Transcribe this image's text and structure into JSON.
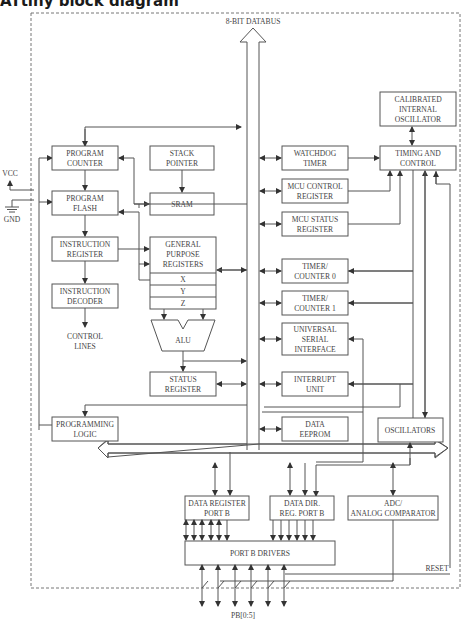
{
  "title": "ATtiny block diagram",
  "diagram": {
    "databus_label": "8-BIT DATABUS",
    "power": {
      "vcc": "VCC",
      "gnd": "GND"
    },
    "blocks": {
      "program_counter": [
        "PROGRAM",
        "COUNTER"
      ],
      "stack_pointer": [
        "STACK",
        "POINTER"
      ],
      "program_flash": [
        "PROGRAM",
        "FLASH"
      ],
      "sram": [
        "SRAM"
      ],
      "instruction_register": [
        "INSTRUCTION",
        "REGISTER"
      ],
      "instruction_decoder": [
        "INSTRUCTION",
        "DECODER"
      ],
      "control_lines": [
        "CONTROL",
        "LINES"
      ],
      "general_purpose_registers": [
        "GENERAL",
        "PURPOSE",
        "REGISTERS"
      ],
      "gpr_x": "X",
      "gpr_y": "Y",
      "gpr_z": "Z",
      "alu": "ALU",
      "status_register": [
        "STATUS",
        "REGISTER"
      ],
      "watchdog_timer": [
        "WATCHDOG",
        "TIMER"
      ],
      "mcu_control_register": [
        "MCU CONTROL",
        "REGISTER"
      ],
      "mcu_status_register": [
        "MCU STATUS",
        "REGISTER"
      ],
      "timer_counter_0": [
        "TIMER/",
        "COUNTER 0"
      ],
      "timer_counter_1": [
        "TIMER/",
        "COUNTER 1"
      ],
      "universal_serial_interface": [
        "UNIVERSAL",
        "SERIAL",
        "INTERFACE"
      ],
      "interrupt_unit": [
        "INTERRUPT",
        "UNIT"
      ],
      "data_eeprom": [
        "DATA",
        "EEPROM"
      ],
      "calibrated_internal_oscillator": [
        "CALIBRATED",
        "INTERNAL",
        "OSCILLATOR"
      ],
      "timing_and_control": [
        "TIMING AND",
        "CONTROL"
      ],
      "oscillators": [
        "OSCILLATORS"
      ],
      "programming_logic": [
        "PROGRAMMING",
        "LOGIC"
      ],
      "data_register_port_b": [
        "DATA REGISTER",
        "PORT B"
      ],
      "data_dir_reg_port_b": [
        "DATA DIR.",
        "REG. PORT B"
      ],
      "adc_analog_comparator": [
        "ADC/",
        "ANALOG COMPARATOR"
      ],
      "port_b_drivers": [
        "PORT B DRIVERS"
      ]
    },
    "reset_label": "RESET",
    "pins_label": "PB[0:5]"
  }
}
